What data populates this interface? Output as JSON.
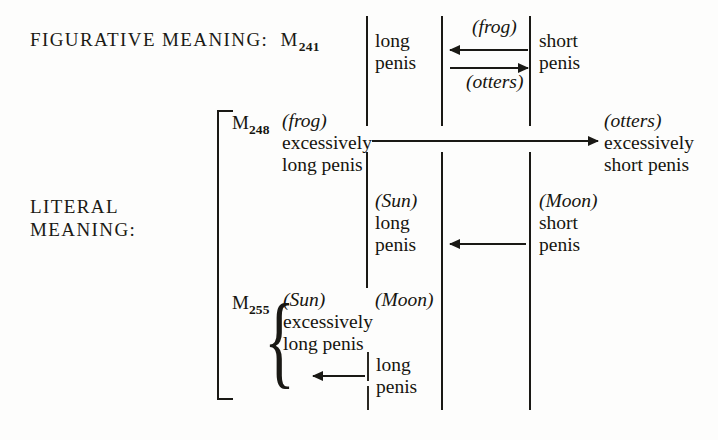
{
  "figure": {
    "type": "diagram",
    "caption_free": true,
    "sections": [
      {
        "id": "figurative",
        "label": "FIGURATIVE MEANING:",
        "myth": "M",
        "myth_sub": "241"
      },
      {
        "id": "literal",
        "label_line1": "LITERAL",
        "label_line2": "MEANING:"
      }
    ],
    "myth_labels": [
      {
        "id": "m241",
        "base": "M",
        "sub": "241"
      },
      {
        "id": "m248",
        "base": "M",
        "sub": "248"
      },
      {
        "id": "m255",
        "base": "M",
        "sub": "255"
      }
    ],
    "cells": [
      {
        "id": "fig-long-penis",
        "lines": [
          "long",
          "penis"
        ]
      },
      {
        "id": "fig-short-penis",
        "lines": [
          "short",
          "penis"
        ]
      },
      {
        "id": "m248-frog-excessive-long",
        "paren": "frog",
        "lines": [
          "excessively",
          "long penis"
        ]
      },
      {
        "id": "m248-otters-excessive-short",
        "paren": "otters",
        "lines": [
          "excessively",
          "short penis"
        ]
      },
      {
        "id": "lit-sun-long-penis",
        "paren": "Sun",
        "lines": [
          "long",
          "penis"
        ]
      },
      {
        "id": "lit-moon-short-penis",
        "paren": "Moon",
        "lines": [
          "short",
          "penis"
        ]
      },
      {
        "id": "m255-sun-excessive-long",
        "paren": "Sun",
        "lines": [
          "excessively",
          "long penis"
        ]
      },
      {
        "id": "m255-moon",
        "paren": "Moon",
        "lines": []
      },
      {
        "id": "m255-long-penis",
        "lines": [
          "long",
          "penis"
        ]
      }
    ],
    "paren_labels": {
      "frog": "(frog)",
      "otters": "(otters)",
      "sun": "(Sun)",
      "moon": "(Moon)"
    },
    "arrow_labels": [
      {
        "id": "arrow-frog-label",
        "text": "(frog)",
        "direction": "left",
        "position": "above"
      },
      {
        "id": "arrow-otters-label",
        "text": "(otters)",
        "direction": "right",
        "position": "below"
      }
    ],
    "text": {
      "long": "long",
      "penis": "penis",
      "short": "short",
      "excessively": "excessively",
      "long_penis": "long penis",
      "short_penis": "short penis",
      "paren_frog": "(frog)",
      "paren_otters": "(otters)",
      "paren_sun": "(Sun)",
      "paren_moon": "(Moon)",
      "figurative_meaning": "FIGURATIVE MEANING:",
      "literal_line1": "LITERAL",
      "literal_line2": "MEANING:",
      "m": "M",
      "sub241": "241",
      "sub248": "248",
      "sub255": "255"
    },
    "colors": {
      "ink": "#1a1915",
      "paper": "#fdfdfc"
    }
  }
}
